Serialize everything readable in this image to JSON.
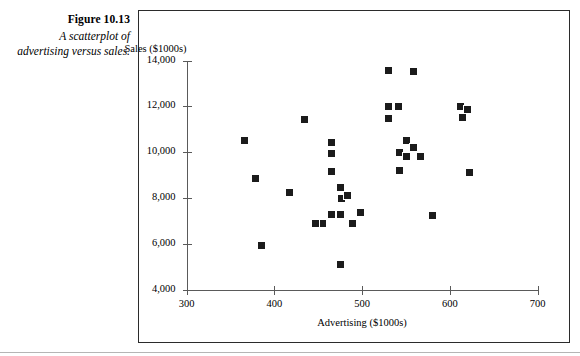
{
  "figure": {
    "number": "Figure 10.13",
    "caption": "A scatterplot of advertising versus sales."
  },
  "chart_data": {
    "type": "scatter",
    "title": "",
    "xlabel": "Advertising ($1000s)",
    "ylabel": "Sales ($1000s)",
    "xlim": [
      300,
      700
    ],
    "ylim": [
      4000,
      14000
    ],
    "xticks": [
      "300",
      "400",
      "500",
      "600",
      "700"
    ],
    "xtick_values": [
      300,
      400,
      500,
      600,
      700
    ],
    "yticks": [
      "4,000",
      "6,000",
      "8,000",
      "10,000",
      "12,000",
      "14,000"
    ],
    "ytick_values": [
      4000,
      6000,
      8000,
      10000,
      12000,
      14000
    ],
    "grid": false,
    "legend": null,
    "marker": "filled-square",
    "marker_color": "#1b1b1b",
    "points": [
      {
        "x": 366,
        "y": 10500
      },
      {
        "x": 379,
        "y": 8860
      },
      {
        "x": 386,
        "y": 5900
      },
      {
        "x": 417,
        "y": 8250
      },
      {
        "x": 434,
        "y": 11420
      },
      {
        "x": 465,
        "y": 10440
      },
      {
        "x": 465,
        "y": 9950
      },
      {
        "x": 465,
        "y": 9170
      },
      {
        "x": 476,
        "y": 8470
      },
      {
        "x": 477,
        "y": 7980
      },
      {
        "x": 484,
        "y": 8110
      },
      {
        "x": 465,
        "y": 7290
      },
      {
        "x": 475,
        "y": 7290
      },
      {
        "x": 498,
        "y": 7350
      },
      {
        "x": 455,
        "y": 6870
      },
      {
        "x": 447,
        "y": 6870
      },
      {
        "x": 489,
        "y": 6880
      },
      {
        "x": 476,
        "y": 5070
      },
      {
        "x": 530,
        "y": 13560
      },
      {
        "x": 559,
        "y": 13500
      },
      {
        "x": 530,
        "y": 11980
      },
      {
        "x": 542,
        "y": 11980
      },
      {
        "x": 530,
        "y": 11460
      },
      {
        "x": 551,
        "y": 10500
      },
      {
        "x": 559,
        "y": 10210
      },
      {
        "x": 543,
        "y": 9990
      },
      {
        "x": 551,
        "y": 9800
      },
      {
        "x": 567,
        "y": 9800
      },
      {
        "x": 543,
        "y": 9180
      },
      {
        "x": 580,
        "y": 7230
      },
      {
        "x": 612,
        "y": 12000
      },
      {
        "x": 620,
        "y": 11880
      },
      {
        "x": 614,
        "y": 11500
      },
      {
        "x": 622,
        "y": 9110
      }
    ]
  }
}
